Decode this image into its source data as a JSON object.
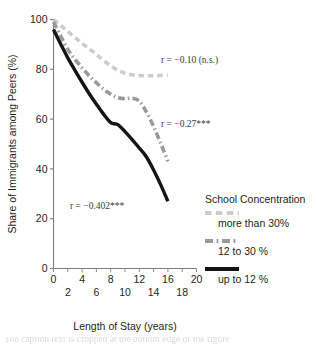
{
  "chart_data": {
    "type": "line",
    "title": "",
    "xlabel": "Length of Stay (years)",
    "ylabel": "Share of Immigrants among Peers (%)",
    "xlim": [
      0,
      20
    ],
    "ylim": [
      0,
      100
    ],
    "grid": false,
    "legend_position": "right-bottom",
    "legend_title": "School Concentration",
    "x_ticks_upper": [
      "0",
      "4",
      "8",
      "12",
      "16",
      "20"
    ],
    "x_ticks_lower": [
      "2",
      "6",
      "10",
      "14",
      "18"
    ],
    "x_tick_values_upper": [
      0,
      4,
      8,
      12,
      16,
      20
    ],
    "x_tick_values_lower": [
      2,
      6,
      10,
      14,
      18
    ],
    "y_ticks": [
      "0",
      "20",
      "40",
      "60",
      "80",
      "100"
    ],
    "y_tick_values": [
      0,
      20,
      40,
      60,
      80,
      100
    ],
    "x": [
      0,
      1,
      2,
      3,
      4,
      5,
      6,
      7,
      8,
      9,
      10,
      11,
      12,
      13,
      14,
      15,
      16
    ],
    "series": [
      {
        "name": "more than 30%",
        "style": "dashed",
        "color": "#cccccc",
        "width": 3.6,
        "values": [
          100.0,
          97.6,
          95.2,
          92.8,
          90.4,
          88.2,
          86.0,
          83.6,
          81.4,
          79.6,
          78.4,
          77.8,
          77.5,
          77.4,
          77.4,
          77.5,
          77.6
        ]
      },
      {
        "name": "12 to 30 %",
        "style": "dash-dot",
        "color": "#9a9a9a",
        "width": 3.6,
        "values": [
          99.0,
          93.4,
          88.0,
          84.0,
          80.6,
          77.4,
          74.6,
          72.0,
          70.0,
          68.6,
          68.2,
          68.4,
          67.2,
          62.8,
          57.0,
          50.2,
          43.0
        ]
      },
      {
        "name": "up to 12 %",
        "style": "solid",
        "color": "#141414",
        "width": 3.4,
        "values": [
          96.0,
          90.2,
          84.6,
          79.6,
          74.8,
          70.2,
          66.0,
          62.0,
          58.6,
          57.8,
          55.0,
          51.8,
          48.4,
          44.8,
          39.6,
          33.6,
          27.0
        ]
      }
    ],
    "annotations": [
      {
        "text": "r = −0.10 (n.s.)",
        "x_px": 161,
        "y_px": 63
      },
      {
        "text": "r = −0.27***",
        "x_px": 161,
        "y_px": 127
      },
      {
        "text": "r = −0.402***",
        "x_px": 70,
        "y_px": 209
      }
    ],
    "legend_entries": [
      {
        "label": "more than 30%",
        "style": "dashed",
        "color": "#cccccc"
      },
      {
        "label": "12 to 30 %",
        "style": "dash-dot",
        "color": "#9a9a9a"
      },
      {
        "label": "up to 12 %",
        "style": "solid",
        "color": "#141414"
      }
    ]
  },
  "caption": {
    "cut_text": "The caption text is cropped at the bottom edge of the figure"
  }
}
